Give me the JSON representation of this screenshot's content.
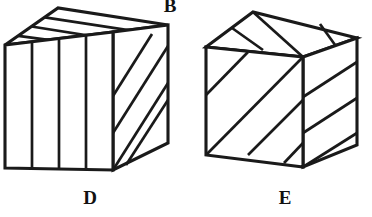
{
  "figure": {
    "title": "",
    "background_color": "#ffffff",
    "line_color": "#1a1a1a",
    "face_color": "#ffffff",
    "canvas": {
      "width": 372,
      "height": 217
    },
    "labels": [
      {
        "id": "B",
        "text": "B",
        "x": 170,
        "y": 6,
        "clipped_top": true
      },
      {
        "id": "D",
        "text": "D",
        "x": 90,
        "y": 198
      },
      {
        "id": "E",
        "text": "E",
        "x": 285,
        "y": 198
      }
    ],
    "objects": [
      {
        "name": "cube-d",
        "label": "D",
        "description": "isometric cube, front face split into 4 vertical panels, top face split into 3 parallel bands, right face split by diagonal stripes",
        "front_face": [
          [
            5,
            45
          ],
          [
            113,
            32
          ],
          [
            113,
            170
          ],
          [
            5,
            168
          ]
        ],
        "top_face": [
          [
            5,
            45
          ],
          [
            58,
            8
          ],
          [
            168,
            25
          ],
          [
            113,
            32
          ]
        ],
        "right_face": [
          [
            113,
            32
          ],
          [
            168,
            25
          ],
          [
            168,
            143
          ],
          [
            113,
            170
          ]
        ],
        "front_dividers": 3,
        "top_dividers": 3,
        "right_dividers": 3
      },
      {
        "name": "cube-e",
        "label": "E",
        "description": "isometric cube, front face with up-right diagonal stripes, top face radially split into 4 wedges, right face with diagonal stripes",
        "front_face": [
          [
            206,
            47
          ],
          [
            303,
            57
          ],
          [
            303,
            167
          ],
          [
            206,
            155
          ]
        ],
        "top_face": [
          [
            206,
            47
          ],
          [
            253,
            12
          ],
          [
            357,
            38
          ],
          [
            303,
            57
          ]
        ],
        "right_face": [
          [
            303,
            57
          ],
          [
            357,
            38
          ],
          [
            357,
            145
          ],
          [
            303,
            167
          ]
        ],
        "front_dividers": 3,
        "top_dividers": 3,
        "right_dividers": 3
      }
    ]
  }
}
